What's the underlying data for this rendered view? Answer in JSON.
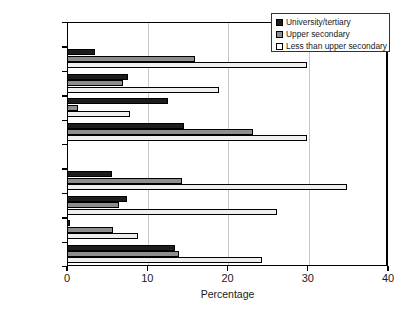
{
  "chart_data": {
    "type": "bar",
    "orientation": "horizontal",
    "title": "",
    "xlabel": "Percentage",
    "ylabel": "",
    "xlim": [
      0,
      40
    ],
    "xticks": [
      0,
      10,
      20,
      30,
      40
    ],
    "grid": true,
    "legend_position": "top-right",
    "categories": [
      "Males",
      "USA",
      "Ireland",
      "Germany",
      "Australia",
      "Females",
      "USA",
      "Ireland",
      "Germany",
      "Australia"
    ],
    "group_headers": [
      "Males",
      "Females"
    ],
    "series": [
      {
        "name": "University/tertiary",
        "color": "#1c1c1c",
        "values": [
          null,
          3.5,
          7.6,
          12.6,
          14.6,
          null,
          5.6,
          7.5,
          0.4,
          13.5
        ]
      },
      {
        "name": "Upper secondary",
        "color": "#8d8d8d",
        "values": [
          null,
          16.0,
          7.0,
          1.4,
          23.2,
          null,
          14.3,
          6.5,
          5.7,
          13.9
        ]
      },
      {
        "name": "Less than upper secondary",
        "color": "#efefef",
        "values": [
          null,
          29.9,
          19.0,
          7.8,
          29.9,
          null,
          34.9,
          26.2,
          8.8,
          24.3
        ]
      }
    ]
  },
  "legend": {
    "items": [
      {
        "label": "University/tertiary",
        "swatch": "black-square-icon"
      },
      {
        "label": "Upper secondary",
        "swatch": "gray-square-icon"
      },
      {
        "label": "Less than upper secondary",
        "swatch": "white-square-icon"
      }
    ]
  },
  "axis": {
    "x_title": "Percentage",
    "x_tick_labels": [
      "0",
      "10",
      "20",
      "30",
      "40"
    ]
  }
}
